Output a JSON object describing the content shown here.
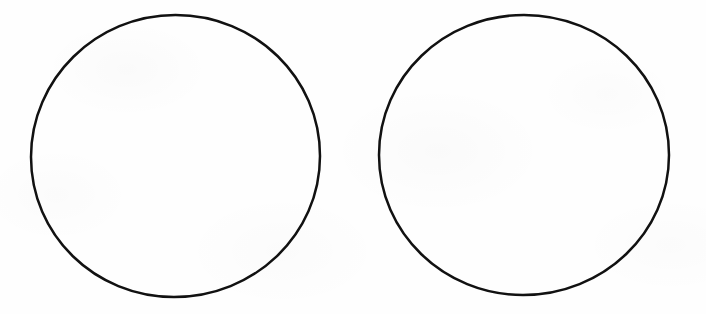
{
  "canvas": {
    "width": 706,
    "height": 314,
    "background_color": "#fefefe",
    "medium": "scanned ink drawing on white paper"
  },
  "drawing": {
    "title": "Two hand-drawn circle outlines",
    "stroke_color": "#111111",
    "fill_color": "none",
    "stroke_width": 2.5,
    "shape_count": 2
  },
  "shapes": [
    {
      "name": "left-circle",
      "type": "circle",
      "label": "Left circle",
      "center_x": 175.5,
      "center_y": 156,
      "radius_x": 144.5,
      "radius_y": 141,
      "bounds": {
        "left": 31,
        "top": 15,
        "right": 320,
        "bottom": 297
      },
      "stroke_color": "#111111",
      "stroke_width": 2.5,
      "fill": "none",
      "path": "M 175.5 15 C 255.5 15 320 78 320 156 C 320 235 254 297 174 297 C 95 297 31 235 31 157 C 31 79 96 15 175.5 15 Z"
    },
    {
      "name": "right-circle",
      "type": "circle",
      "label": "Right circle",
      "center_x": 524,
      "center_y": 155,
      "radius_x": 145,
      "radius_y": 140,
      "bounds": {
        "left": 379,
        "top": 15,
        "right": 669,
        "bottom": 295
      },
      "stroke_color": "#111111",
      "stroke_width": 2.5,
      "fill": "none",
      "path": "M 524 15 C 604 15 669 77 669 155 C 669 233 603 295 523 295 C 444 295 379 233 379 155 C 379 77 444 15 524 15 Z"
    }
  ],
  "layout": {
    "gap_between_circles": 59,
    "arrangement": "side-by-side horizontal pair"
  }
}
